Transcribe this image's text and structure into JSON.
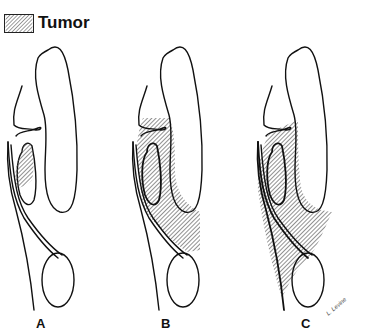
{
  "legend": {
    "label": "Tumor",
    "pattern": "diagonal-hatch"
  },
  "panels": [
    {
      "id": "A",
      "label": "A",
      "tumor_extent": "confined to small region inside inner cavity"
    },
    {
      "id": "B",
      "label": "B",
      "tumor_extent": "fills region around inner cavity, extending down to oval structure"
    },
    {
      "id": "C",
      "label": "C",
      "tumor_extent": "fills region and extends further down along lateral wall beside oval structure"
    }
  ],
  "signature": "L. Levine",
  "colors": {
    "line": "#111111",
    "hatch": "#555555",
    "background": "#ffffff"
  }
}
